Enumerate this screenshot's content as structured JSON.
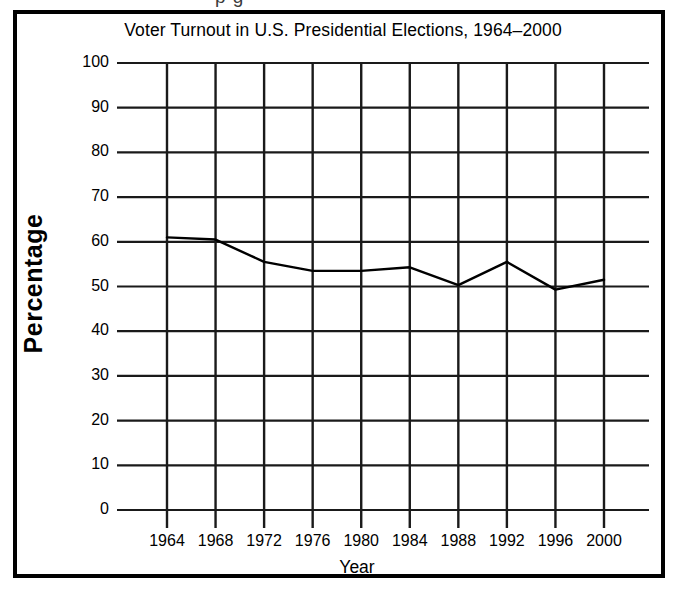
{
  "page": {
    "top_sliver_text": "p g"
  },
  "figure": {
    "title": "Voter Turnout in U.S. Presidential Elections, 1964–2000",
    "y_axis_title": "Percentage",
    "x_axis_title": "Year"
  },
  "chart_data": {
    "type": "line",
    "title": "Voter Turnout in U.S. Presidential Elections, 1964–2000",
    "xlabel": "Year",
    "ylabel": "Percentage",
    "x": [
      1964,
      1968,
      1972,
      1976,
      1980,
      1984,
      1988,
      1992,
      1996,
      2000
    ],
    "categories": [
      "1964",
      "1968",
      "1972",
      "1976",
      "1980",
      "1984",
      "1988",
      "1992",
      "1996",
      "2000"
    ],
    "values": [
      61.0,
      60.5,
      55.5,
      53.5,
      53.5,
      54.3,
      50.3,
      55.5,
      49.3,
      51.5
    ],
    "series": [
      {
        "name": "Voter turnout",
        "values": [
          61.0,
          60.5,
          55.5,
          53.5,
          53.5,
          54.3,
          50.3,
          55.5,
          49.3,
          51.5
        ]
      }
    ],
    "ylim": [
      0,
      100
    ],
    "y_ticks": [
      0,
      10,
      20,
      30,
      40,
      50,
      60,
      70,
      80,
      90,
      100
    ],
    "y_tick_labels": [
      "0",
      "10",
      "20",
      "30",
      "40",
      "50",
      "60",
      "70",
      "80",
      "90",
      "100"
    ],
    "x_tick_labels": [
      "1964",
      "1968",
      "1972",
      "1976",
      "1980",
      "1984",
      "1988",
      "1992",
      "1996",
      "2000"
    ],
    "grid": true,
    "legend": false,
    "line_color": "#000000",
    "grid_color": "#1a1a1a",
    "background_color": "#ffffff"
  }
}
